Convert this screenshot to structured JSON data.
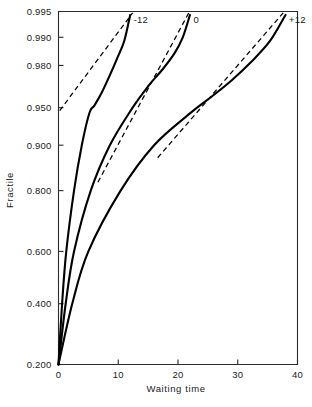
{
  "chart_data": {
    "type": "line",
    "title": "",
    "xlabel": "Waiting time",
    "ylabel": "Fractile",
    "xlim": [
      0,
      40
    ],
    "ylim": [
      0.2,
      0.995
    ],
    "grid": false,
    "legend_position": "inline-curve-labels",
    "y_scale": "normal-probability",
    "xticks": [
      0,
      10,
      20,
      30,
      40
    ],
    "xticklabels": [
      "0",
      "10",
      "20",
      "30",
      "40"
    ],
    "yticks": [
      0.2,
      0.4,
      0.6,
      0.8,
      0.9,
      0.95,
      0.98,
      0.99,
      0.995
    ],
    "yticklabels": [
      "0.200",
      "0.400",
      "0.600",
      "0.800",
      "0.900",
      "0.950",
      "0.980",
      "0.990",
      "0.995"
    ],
    "series": [
      {
        "name": "-12",
        "label": "-12",
        "style": "solid",
        "points": [
          [
            0.0,
            0.2
          ],
          [
            0.6,
            0.4
          ],
          [
            1.3,
            0.6
          ],
          [
            2.6,
            0.8
          ],
          [
            3.9,
            0.9
          ],
          [
            5.2,
            0.945
          ],
          [
            6.0,
            0.952
          ],
          [
            7.2,
            0.963
          ],
          [
            8.6,
            0.975
          ],
          [
            9.8,
            0.983
          ],
          [
            11.0,
            0.989
          ],
          [
            12.0,
            0.9945
          ]
        ]
      },
      {
        "name": "0",
        "label": "0",
        "style": "solid",
        "points": [
          [
            0.0,
            0.2
          ],
          [
            1.2,
            0.4
          ],
          [
            2.6,
            0.6
          ],
          [
            5.4,
            0.8
          ],
          [
            8.6,
            0.9
          ],
          [
            12.4,
            0.95
          ],
          [
            15.0,
            0.968
          ],
          [
            17.4,
            0.978
          ],
          [
            19.4,
            0.985
          ],
          [
            20.8,
            0.99
          ],
          [
            22.0,
            0.9945
          ]
        ]
      },
      {
        "name": "+12",
        "label": "+12",
        "style": "solid",
        "points": [
          [
            0.0,
            0.2
          ],
          [
            2.3,
            0.4
          ],
          [
            5.0,
            0.6
          ],
          [
            10.4,
            0.8
          ],
          [
            16.0,
            0.9
          ],
          [
            22.0,
            0.944
          ],
          [
            25.6,
            0.96
          ],
          [
            29.0,
            0.972
          ],
          [
            32.4,
            0.982
          ],
          [
            35.4,
            0.989
          ],
          [
            38.0,
            0.9945
          ]
        ]
      }
    ],
    "reference_lines": [
      {
        "name": "-12-reference",
        "style": "dashed",
        "for_series": "-12",
        "points": [
          [
            0.2,
            0.947
          ],
          [
            12.4,
            0.9948
          ]
        ]
      },
      {
        "name": "0-reference",
        "style": "dashed",
        "for_series": "0",
        "points": [
          [
            6.6,
            0.822
          ],
          [
            21.8,
            0.9948
          ]
        ]
      },
      {
        "name": "+12-reference",
        "style": "dashed",
        "for_series": "+12",
        "points": [
          [
            16.6,
            0.877
          ],
          [
            37.6,
            0.9948
          ]
        ]
      }
    ]
  },
  "axes": {
    "x_title": "Waiting time",
    "y_title": "Fractile"
  }
}
